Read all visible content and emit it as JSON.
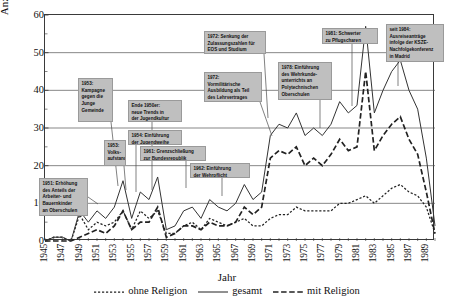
{
  "chart_data": {
    "type": "line",
    "title": "",
    "xlabel": "Jahr",
    "ylabel": "Anzahl Geschädigter",
    "ylim": [
      0,
      60
    ],
    "ytick_labels": [
      "0",
      "10",
      "20",
      "30",
      "40",
      "50",
      "60"
    ],
    "yticks": [
      0,
      10,
      20,
      30,
      40,
      50,
      60
    ],
    "xlim": [
      1945,
      1990
    ],
    "grid": "horizontal",
    "legend_position": "bottom-center",
    "x": [
      1945,
      1946,
      1947,
      1948,
      1949,
      1950,
      1951,
      1952,
      1953,
      1954,
      1955,
      1956,
      1957,
      1958,
      1959,
      1960,
      1961,
      1962,
      1963,
      1964,
      1965,
      1966,
      1967,
      1968,
      1969,
      1970,
      1971,
      1972,
      1973,
      1974,
      1975,
      1976,
      1977,
      1978,
      1979,
      1980,
      1981,
      1982,
      1983,
      1984,
      1985,
      1986,
      1987,
      1988,
      1989,
      1990
    ],
    "xtick_labels": [
      "1945",
      "1947",
      "1949",
      "1951",
      "1953",
      "1955",
      "1957",
      "1959",
      "1961",
      "1963",
      "1965",
      "1967",
      "1969",
      "1971",
      "1973",
      "1975",
      "1977",
      "1979",
      "1981",
      "1983",
      "1985",
      "1987",
      "1989"
    ],
    "xticks": [
      1945,
      1947,
      1949,
      1951,
      1953,
      1955,
      1957,
      1959,
      1961,
      1963,
      1965,
      1967,
      1969,
      1971,
      1973,
      1975,
      1977,
      1979,
      1981,
      1983,
      1985,
      1987,
      1989
    ],
    "series": [
      {
        "name": "gesamt",
        "style": "solid",
        "color": "#333333",
        "values": [
          0,
          1,
          1,
          0,
          8,
          5,
          8,
          6,
          9,
          16,
          6,
          13,
          11,
          17,
          3,
          4,
          8,
          9,
          6,
          11,
          9,
          8,
          10,
          15,
          11,
          13,
          28,
          31,
          30,
          34,
          28,
          30,
          28,
          31,
          37,
          34,
          36,
          57,
          34,
          40,
          45,
          48,
          40,
          35,
          22,
          4
        ]
      },
      {
        "name": "mit Religion",
        "style": "dashed",
        "color": "#222222",
        "values": [
          0,
          0,
          0,
          0,
          1,
          2,
          3,
          2,
          4,
          8,
          3,
          5,
          5,
          9,
          1,
          2,
          4,
          4,
          3,
          5,
          4,
          4,
          5,
          9,
          7,
          9,
          22,
          24,
          23,
          25,
          20,
          22,
          20,
          23,
          27,
          24,
          25,
          45,
          24,
          28,
          31,
          33,
          27,
          23,
          13,
          2
        ]
      },
      {
        "name": "ohne Religion",
        "style": "dotted",
        "color": "#222222",
        "values": [
          0,
          1,
          1,
          0,
          7,
          3,
          5,
          4,
          5,
          8,
          3,
          8,
          6,
          8,
          2,
          2,
          4,
          5,
          3,
          6,
          5,
          4,
          5,
          6,
          4,
          4,
          6,
          7,
          7,
          9,
          8,
          8,
          8,
          8,
          10,
          10,
          11,
          12,
          10,
          12,
          14,
          15,
          13,
          12,
          9,
          2
        ]
      }
    ],
    "annotations": [
      {
        "id": "ann-1951",
        "text": "1951: Erhöhung des Anteils der Arbeiter- und Bauernkinder an Oberschulen",
        "lines": [
          "1951: Erhöhung",
          "des Anteils der",
          "Arbeiter- und",
          "Bauernkinder",
          "an Oberschulen"
        ]
      },
      {
        "id": "ann-1953-kampagne",
        "text": "1953: Kampagne gegen die Junge Gemeinde",
        "lines": [
          "1953:",
          "Kampagne",
          "gegen die",
          "Junge",
          "Gemeinde"
        ]
      },
      {
        "id": "ann-1953-volksaufstand",
        "text": "1953: Volksaufstand",
        "lines": [
          "1953:",
          "Volks-",
          "aufstand"
        ]
      },
      {
        "id": "ann-1954",
        "text": "1954: Einführung der Jugendweihe",
        "lines": [
          "1954: Einführung",
          "der Jugendweihe"
        ]
      },
      {
        "id": "ann-ende1950er",
        "text": "Ende 1950er: neue Trends in der Jugendkultur",
        "lines": [
          "Ende 1950er:",
          "neue Trends in",
          "der Jugendkultur"
        ]
      },
      {
        "id": "ann-1961",
        "text": "1961: Grenzschließung zur Bundesrepublik",
        "lines": [
          "1961: Grenzschließung",
          "zur Bundesrepublik"
        ]
      },
      {
        "id": "ann-1962",
        "text": "1962: Einführung der Wehrpflicht",
        "lines": [
          "1962: Einführung",
          "der Wehrpflicht"
        ]
      },
      {
        "id": "ann-1972-senkung",
        "text": "1972: Senkung der Zulassungszahlen für EOS und Studium",
        "lines": [
          "1972: Senkung der",
          "Zulassungszahlen für",
          "EOS und Studium"
        ]
      },
      {
        "id": "ann-1972-vormilitaerisch",
        "text": "1972: Vormilitärische Ausbildung als Teil des Lehrvertrages",
        "lines": [
          "1972:",
          "Vormilitärische",
          "Ausbildung als Teil",
          "des Lehrvertrages"
        ]
      },
      {
        "id": "ann-1978",
        "text": "1978: Einführung des Wehrkundeunterrichts an Polytechnischen Oberschulen",
        "lines": [
          "1978: Einführung",
          "des Wehrkunde-",
          "unterrichts an",
          "Polytechnischen",
          "Oberschulen"
        ]
      },
      {
        "id": "ann-1981",
        "text": "1981: Schwerter zu Pflugscharen",
        "lines": [
          "1981: Schwerter",
          "zu Pflugscharen"
        ]
      },
      {
        "id": "ann-1984",
        "text": "seit 1984: Ausreiseanträge infolge der KSZE-Nachfolgekonferenz in Madrid",
        "lines": [
          "seit 1984:",
          "Ausreiseanträge",
          "infolge der KSZE-",
          "Nachfolgekonferenz",
          "in Madrid"
        ]
      }
    ]
  },
  "legend": {
    "items": [
      {
        "label": "ohne Religion",
        "style": "dotted"
      },
      {
        "label": "gesamt",
        "style": "solid"
      },
      {
        "label": "mit Religion",
        "style": "dashed"
      }
    ]
  }
}
